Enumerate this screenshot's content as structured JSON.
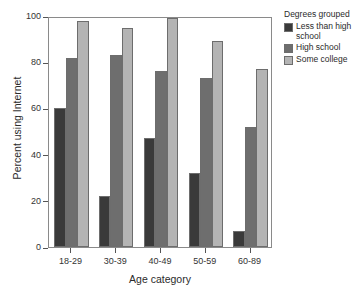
{
  "chart_data": {
    "type": "bar",
    "title": "",
    "xlabel": "Age category",
    "ylabel": "Percent using Internet",
    "categories": [
      "18-29",
      "30-39",
      "40-49",
      "50-59",
      "60-89"
    ],
    "series": [
      {
        "name": "Less than high school",
        "color": "#3a3a3a",
        "values": [
          60,
          22,
          47,
          32,
          7
        ]
      },
      {
        "name": "High school",
        "color": "#6e6e6e",
        "values": [
          82,
          83,
          76,
          73,
          52
        ]
      },
      {
        "name": "Some college",
        "color": "#b4b4b4",
        "values": [
          98,
          95,
          99,
          89,
          77
        ]
      }
    ],
    "ylim": [
      0,
      100
    ],
    "yticks": [
      0,
      20,
      40,
      60,
      80,
      100
    ],
    "ytick_labels": [
      "0",
      "20",
      "40",
      "60",
      "80",
      "100"
    ],
    "grid": false,
    "legend_position": "right",
    "legend_title": "Degrees grouped"
  }
}
